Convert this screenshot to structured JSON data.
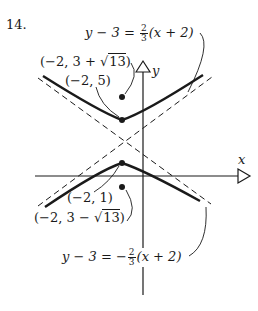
{
  "problem_number": "14.",
  "axes": {
    "x_label": "x",
    "y_label": "y"
  },
  "labels": {
    "asymptote_upper": {
      "lhs": "y − 3 = ",
      "num": "2",
      "den": "3",
      "rhs": "(x + 2)"
    },
    "asymptote_lower": {
      "lhs": "y − 3 = −",
      "num": "2",
      "den": "3",
      "rhs": "(x + 2)"
    },
    "focus_upper": {
      "pre": "(−2, 3 + ",
      "rad": "13",
      "post": ")"
    },
    "vertex_upper": "(−2, 5)",
    "vertex_lower": "(−2, 1)",
    "focus_lower": {
      "pre": "(−2, 3 − ",
      "rad": "13",
      "post": ")"
    }
  },
  "math": {
    "center": [
      -2,
      3
    ],
    "vertices": [
      [
        -2,
        5
      ],
      [
        -2,
        1
      ]
    ],
    "foci": [
      "(-2, 3+sqrt(13))",
      "(-2, 3-sqrt(13))"
    ],
    "asymptotes": [
      "y-3 = 2/3 (x+2)",
      "y-3 = -2/3 (x+2)"
    ]
  },
  "colors": {
    "ink": "#1a1a1a",
    "background": "#ffffff"
  }
}
